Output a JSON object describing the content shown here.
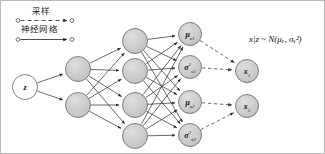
{
  "diagram": {
    "background_color": "#ffffff",
    "border_color": "#b9b9b9",
    "node_fill": "#c9c9c9",
    "node_fill_empty": "#ffffff",
    "node_stroke": "#6e6e6e",
    "edge_color": "#3a3a3a",
    "dashed_edge_color": "#555555"
  },
  "legend": {
    "items": [
      {
        "label": "采样",
        "style": "dashed",
        "marker": "arrow",
        "endpoint": "circle"
      },
      {
        "label": "神经网络",
        "style": "solid",
        "marker": "arrow",
        "endpoint": "circle"
      }
    ]
  },
  "formula": {
    "text": "x|z ~ N(μₓ, σₓ²)",
    "parts": {
      "lhs": "x|z",
      "relation": "~",
      "distribution": "N",
      "mean": "μ",
      "mean_sub": "x",
      "variance": "σ",
      "variance_sub": "x",
      "variance_sup": "2"
    }
  },
  "layers": [
    {
      "name": "input-layer",
      "nodes": [
        {
          "id": "z",
          "label": "z",
          "cx": 24,
          "cy": 86,
          "r": 12.5,
          "filled": false
        }
      ]
    },
    {
      "name": "hidden-layer-1",
      "nodes": [
        {
          "id": "h1-1",
          "label": "",
          "cx": 77,
          "cy": 68,
          "r": 12.5,
          "filled": true
        },
        {
          "id": "h1-2",
          "label": "",
          "cx": 77,
          "cy": 104,
          "r": 12.5,
          "filled": true
        }
      ]
    },
    {
      "name": "hidden-layer-2",
      "nodes": [
        {
          "id": "h2-1",
          "label": "",
          "cx": 134,
          "cy": 40,
          "r": 12.5,
          "filled": true
        },
        {
          "id": "h2-2",
          "label": "",
          "cx": 134,
          "cy": 70,
          "r": 12.5,
          "filled": true
        },
        {
          "id": "h2-3",
          "label": "",
          "cx": 134,
          "cy": 104,
          "r": 12.5,
          "filled": true
        },
        {
          "id": "h2-4",
          "label": "",
          "cx": 134,
          "cy": 135,
          "r": 12.5,
          "filled": true
        }
      ]
    },
    {
      "name": "parameter-layer",
      "nodes": [
        {
          "id": "mu-x1",
          "label": "μ",
          "sub": "x1",
          "sup": "",
          "cx": 189,
          "cy": 33,
          "r": 11.5,
          "filled": true
        },
        {
          "id": "sigma2-x1",
          "label": "σ",
          "sub": "x1",
          "sup": "2",
          "cx": 189,
          "cy": 66,
          "r": 11.5,
          "filled": true
        },
        {
          "id": "mu-x2",
          "label": "μ",
          "sub": "x2",
          "sup": "",
          "cx": 189,
          "cy": 101,
          "r": 11.5,
          "filled": true
        },
        {
          "id": "sigma2-x2",
          "label": "σ",
          "sub": "x2",
          "sup": "2",
          "cx": 189,
          "cy": 134,
          "r": 11.5,
          "filled": true
        }
      ]
    },
    {
      "name": "output-layer",
      "nodes": [
        {
          "id": "x1",
          "label": "x",
          "sub": "1",
          "cx": 246,
          "cy": 70,
          "r": 11.5,
          "filled": true
        },
        {
          "id": "x2",
          "label": "x",
          "sub": "2",
          "cx": 246,
          "cy": 105,
          "r": 11.5,
          "filled": true
        }
      ]
    }
  ],
  "edges": {
    "network": [
      [
        "z",
        "h1-1"
      ],
      [
        "z",
        "h1-2"
      ],
      [
        "h1-1",
        "h2-1"
      ],
      [
        "h1-1",
        "h2-2"
      ],
      [
        "h1-1",
        "h2-3"
      ],
      [
        "h1-1",
        "h2-4"
      ],
      [
        "h1-2",
        "h2-1"
      ],
      [
        "h1-2",
        "h2-2"
      ],
      [
        "h1-2",
        "h2-3"
      ],
      [
        "h1-2",
        "h2-4"
      ],
      [
        "h2-1",
        "mu-x1"
      ],
      [
        "h2-1",
        "sigma2-x1"
      ],
      [
        "h2-1",
        "mu-x2"
      ],
      [
        "h2-1",
        "sigma2-x2"
      ],
      [
        "h2-2",
        "mu-x1"
      ],
      [
        "h2-2",
        "sigma2-x1"
      ],
      [
        "h2-2",
        "mu-x2"
      ],
      [
        "h2-2",
        "sigma2-x2"
      ],
      [
        "h2-3",
        "mu-x1"
      ],
      [
        "h2-3",
        "sigma2-x1"
      ],
      [
        "h2-3",
        "mu-x2"
      ],
      [
        "h2-3",
        "sigma2-x2"
      ],
      [
        "h2-4",
        "mu-x1"
      ],
      [
        "h2-4",
        "sigma2-x1"
      ],
      [
        "h2-4",
        "mu-x2"
      ],
      [
        "h2-4",
        "sigma2-x2"
      ]
    ],
    "sampling": [
      [
        "mu-x1",
        "x1"
      ],
      [
        "sigma2-x1",
        "x1"
      ],
      [
        "mu-x2",
        "x2"
      ],
      [
        "sigma2-x2",
        "x2"
      ]
    ]
  }
}
